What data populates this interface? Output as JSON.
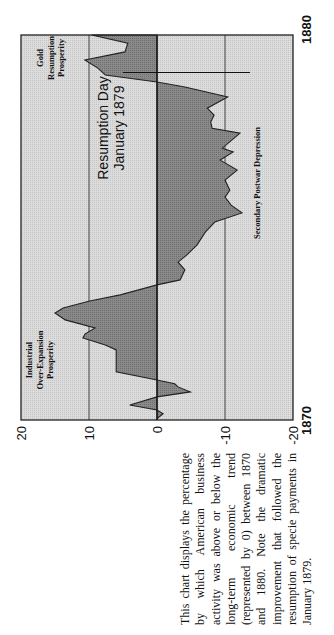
{
  "chart_data": {
    "type": "area",
    "orientation": "rotated 90° counter-clockwise (time runs bottom-to-top, values left-to-right)",
    "title": "",
    "xlabel": "Year",
    "ylabel": "Percent above/below long-term trend",
    "x_range": [
      1870,
      1880
    ],
    "ylim": [
      -20,
      20
    ],
    "x_tick_labels": [
      "1870",
      "1880"
    ],
    "y_ticks": [
      20,
      10,
      0,
      -10,
      -20
    ],
    "y_tick_labels": [
      "20",
      "10",
      "0",
      "-10",
      "-20"
    ],
    "gridlines": [
      10,
      0,
      -10
    ],
    "series": [
      {
        "name": "American business activity vs. trend",
        "points": [
          [
            1870.0,
            0.0
          ],
          [
            1870.05,
            -0.1
          ],
          [
            1870.16,
            -0.9
          ],
          [
            1870.26,
            0.0
          ],
          [
            1870.39,
            4.0
          ],
          [
            1870.6,
            0.0
          ],
          [
            1870.73,
            -4.9
          ],
          [
            1870.86,
            -3.1
          ],
          [
            1870.94,
            -2.6
          ],
          [
            1871.04,
            0.0
          ],
          [
            1871.25,
            6.0
          ],
          [
            1871.82,
            6.0
          ],
          [
            1871.95,
            7.6
          ],
          [
            1872.13,
            10.9
          ],
          [
            1872.23,
            10.6
          ],
          [
            1872.39,
            9.1
          ],
          [
            1872.6,
            13.5
          ],
          [
            1872.78,
            15.0
          ],
          [
            1872.91,
            13.8
          ],
          [
            1873.09,
            9.9
          ],
          [
            1873.25,
            5.4
          ],
          [
            1873.51,
            0.0
          ],
          [
            1873.64,
            -3.4
          ],
          [
            1873.9,
            -4.1
          ],
          [
            1874.1,
            -3.1
          ],
          [
            1874.29,
            -4.4
          ],
          [
            1874.55,
            -5.9
          ],
          [
            1874.88,
            -7.1
          ],
          [
            1875.14,
            -8.5
          ],
          [
            1875.38,
            -12.5
          ],
          [
            1875.58,
            -10.9
          ],
          [
            1875.79,
            -10.0
          ],
          [
            1875.97,
            -10.7
          ],
          [
            1876.23,
            -10.0
          ],
          [
            1876.49,
            -11.8
          ],
          [
            1876.75,
            -9.3
          ],
          [
            1876.96,
            -11.2
          ],
          [
            1877.06,
            -9.6
          ],
          [
            1877.45,
            -12.2
          ],
          [
            1877.58,
            -8.1
          ],
          [
            1877.74,
            -7.9
          ],
          [
            1877.92,
            -8.4
          ],
          [
            1878.1,
            -7.4
          ],
          [
            1878.39,
            -10.4
          ],
          [
            1878.65,
            -4.1
          ],
          [
            1878.78,
            0.0
          ],
          [
            1878.96,
            7.6
          ],
          [
            1879.14,
            8.7
          ],
          [
            1879.35,
            10.6
          ],
          [
            1879.56,
            4.7
          ],
          [
            1879.79,
            4.3
          ],
          [
            1880.0,
            9.6
          ]
        ]
      }
    ],
    "annotations": [
      {
        "text_lines": [
          "Industrial",
          "Over-Expansion",
          "Prosperity"
        ],
        "near_year": 1872.3,
        "side": "above"
      },
      {
        "text_lines": [
          "Secondary Postwar Depression"
        ],
        "near_year": 1876.7,
        "side": "below"
      },
      {
        "text_lines": [
          "Gold",
          "Resumption",
          "Prosperity"
        ],
        "near_year": 1879.6,
        "side": "above"
      },
      {
        "text_lines": [
          "Resumption Day",
          "January 1879"
        ],
        "marker_year": 1879.0,
        "marker": "line"
      }
    ],
    "grid": false,
    "legend": "none",
    "colors": {
      "fill": "#7f7f7f",
      "background": "#d6d6d6",
      "line": "#222222"
    }
  },
  "caption": "This chart displays the percentage by which American business activity was above or below the long-term economic trend (represented by 0) between 1870 and 1880. Note the dramatic improvement that followed the resumption of specie payments in January 1879."
}
